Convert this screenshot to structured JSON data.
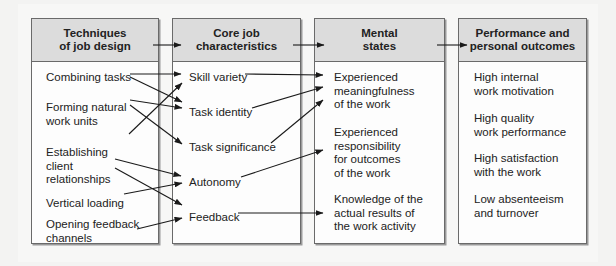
{
  "columns": [
    {
      "header": "Techniques\nof job design",
      "items": [
        "Combining tasks",
        "Forming natural\nwork units",
        "Establishing\nclient\nrelationships",
        "Vertical loading",
        "Opening feedback\nchannels"
      ]
    },
    {
      "header": "Core job\ncharacteristics",
      "items": [
        "Skill variety",
        "Task identity",
        "Task significance",
        "Autonomy",
        "Feedback"
      ]
    },
    {
      "header": "Mental\nstates",
      "items": [
        "Experienced\nmeaningfulness\nof the work",
        "Experienced\nresponsibility\nfor outcomes\nof the work",
        "Knowledge of the\nactual results of\nthe work activity"
      ]
    },
    {
      "header": "Performance and\npersonal outcomes",
      "items": [
        "High internal\nwork motivation",
        "High quality\nwork performance",
        "High satisfaction\nwith the work",
        "Low absenteeism\nand turnover"
      ]
    }
  ],
  "links": [
    {
      "from": "Combining tasks",
      "to": "Skill variety"
    },
    {
      "from": "Combining tasks",
      "to": "Task identity"
    },
    {
      "from": "Forming natural work units",
      "to": "Task identity"
    },
    {
      "from": "Forming natural work units",
      "to": "Task significance"
    },
    {
      "from": "Establishing client relationships",
      "to": "Skill variety"
    },
    {
      "from": "Establishing client relationships",
      "to": "Autonomy"
    },
    {
      "from": "Establishing client relationships",
      "to": "Feedback"
    },
    {
      "from": "Vertical loading",
      "to": "Autonomy"
    },
    {
      "from": "Opening feedback channels",
      "to": "Feedback"
    },
    {
      "from": "Skill variety",
      "to": "Experienced meaningfulness of the work"
    },
    {
      "from": "Task identity",
      "to": "Experienced meaningfulness of the work"
    },
    {
      "from": "Task significance",
      "to": "Experienced meaningfulness of the work"
    },
    {
      "from": "Autonomy",
      "to": "Experienced responsibility for outcomes of the work"
    },
    {
      "from": "Feedback",
      "to": "Knowledge of the actual results of the work activity"
    },
    {
      "from": "Techniques of job design",
      "to": "Core job characteristics"
    },
    {
      "from": "Core job characteristics",
      "to": "Mental states"
    },
    {
      "from": "Mental states",
      "to": "Performance and personal outcomes"
    }
  ]
}
